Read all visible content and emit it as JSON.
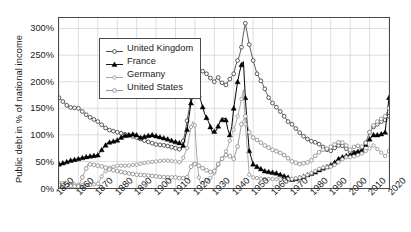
{
  "chart_data": {
    "type": "line",
    "title": "",
    "xlabel": "",
    "ylabel": "Public debt in % of national income",
    "xlim": [
      1850,
      2020
    ],
    "ylim": [
      0,
      320
    ],
    "grid": true,
    "legend_position": "upper-left-inside",
    "ytick_labels": [
      "0%",
      "50%",
      "100%",
      "150%",
      "200%",
      "250%",
      "300%"
    ],
    "ytick_values": [
      0,
      50,
      100,
      150,
      200,
      250,
      300
    ],
    "xtick_labels": [
      "1850",
      "1860",
      "1870",
      "1880",
      "1890",
      "1900",
      "1910",
      "1920",
      "1930",
      "1940",
      "1950",
      "1960",
      "1970",
      "1980",
      "1990",
      "2000",
      "2010",
      "2020"
    ],
    "xtick_values": [
      1850,
      1860,
      1870,
      1880,
      1890,
      1900,
      1910,
      1920,
      1930,
      1940,
      1950,
      1960,
      1970,
      1980,
      1990,
      2000,
      2010,
      2020
    ],
    "series": [
      {
        "name": "United Kingdom",
        "marker": "circle-open-dark",
        "color": "#3b3b3b",
        "x": [
          1850,
          1855,
          1860,
          1865,
          1870,
          1875,
          1880,
          1885,
          1890,
          1895,
          1900,
          1905,
          1910,
          1913,
          1915,
          1918,
          1920,
          1921,
          1922,
          1923,
          1924,
          1925,
          1926,
          1927,
          1928,
          1929,
          1930,
          1931,
          1932,
          1933,
          1934,
          1935,
          1936,
          1937,
          1938,
          1939,
          1940,
          1941,
          1942,
          1943,
          1944,
          1945,
          1946,
          1947,
          1948,
          1950,
          1952,
          1955,
          1958,
          1960,
          1963,
          1965,
          1968,
          1970,
          1973,
          1975,
          1978,
          1980,
          1983,
          1985,
          1988,
          1990,
          1993,
          1995,
          1998,
          2000,
          2003,
          2005,
          2008,
          2010,
          2012,
          2014,
          2016,
          2018,
          2020
        ],
        "y": [
          170,
          152,
          150,
          135,
          125,
          110,
          105,
          100,
          95,
          88,
          82,
          80,
          75,
          72,
          105,
          170,
          200,
          222,
          224,
          222,
          220,
          218,
          215,
          210,
          207,
          203,
          200,
          206,
          208,
          200,
          198,
          196,
          194,
          200,
          205,
          210,
          215,
          230,
          240,
          250,
          265,
          290,
          310,
          290,
          270,
          240,
          215,
          195,
          170,
          160,
          148,
          140,
          125,
          120,
          108,
          100,
          92,
          88,
          85,
          80,
          72,
          70,
          78,
          82,
          74,
          68,
          66,
          68,
          85,
          105,
          115,
          120,
          125,
          128,
          135
        ]
      },
      {
        "name": "France",
        "marker": "triangle-filled",
        "color": "#000000",
        "x": [
          1850,
          1853,
          1856,
          1860,
          1863,
          1866,
          1870,
          1872,
          1875,
          1878,
          1880,
          1883,
          1886,
          1889,
          1892,
          1895,
          1898,
          1900,
          1903,
          1906,
          1909,
          1912,
          1914,
          1916,
          1918,
          1919,
          1920,
          1921,
          1922,
          1923,
          1925,
          1927,
          1929,
          1931,
          1933,
          1935,
          1936,
          1937,
          1938,
          1939,
          1940,
          1941,
          1942,
          1943,
          1944,
          1945,
          1946,
          1947,
          1948,
          1950,
          1953,
          1956,
          1959,
          1962,
          1965,
          1968,
          1970,
          1973,
          1976,
          1979,
          1982,
          1985,
          1988,
          1991,
          1994,
          1997,
          2000,
          2003,
          2006,
          2009,
          2012,
          2015,
          2018,
          2020
        ],
        "y": [
          45,
          48,
          52,
          55,
          58,
          60,
          62,
          72,
          85,
          88,
          90,
          98,
          100,
          102,
          95,
          98,
          100,
          98,
          95,
          92,
          88,
          85,
          80,
          110,
          160,
          175,
          178,
          180,
          175,
          165,
          140,
          125,
          105,
          108,
          125,
          132,
          128,
          110,
          100,
          115,
          150,
          175,
          200,
          218,
          232,
          238,
          170,
          115,
          70,
          45,
          38,
          32,
          30,
          28,
          24,
          20,
          16,
          18,
          22,
          26,
          30,
          36,
          40,
          45,
          55,
          60,
          62,
          68,
          70,
          88,
          100,
          100,
          105,
          170
        ]
      },
      {
        "name": "Germany",
        "marker": "star-light",
        "color": "#9a9a9a",
        "x": [
          1850,
          1855,
          1860,
          1865,
          1870,
          1873,
          1876,
          1880,
          1885,
          1890,
          1895,
          1900,
          1905,
          1910,
          1913,
          1916,
          1918,
          1919,
          1920,
          1921,
          1922,
          1923,
          1925,
          1927,
          1929,
          1931,
          1933,
          1935,
          1937,
          1939,
          1941,
          1943,
          1945,
          1946,
          1948,
          1950,
          1953,
          1956,
          1960,
          1965,
          1970,
          1975,
          1980,
          1985,
          1990,
          1993,
          1995,
          1998,
          2000,
          2003,
          2006,
          2009,
          2012,
          2015,
          2018,
          2020
        ],
        "y": [
          10,
          8,
          6,
          5,
          8,
          28,
          38,
          42,
          42,
          44,
          48,
          50,
          52,
          50,
          48,
          75,
          115,
          125,
          118,
          60,
          20,
          8,
          12,
          16,
          22,
          35,
          52,
          60,
          78,
          100,
          120,
          150,
          185,
          120,
          25,
          20,
          18,
          17,
          17,
          16,
          17,
          20,
          28,
          38,
          40,
          45,
          52,
          58,
          58,
          60,
          65,
          72,
          80,
          70,
          60,
          70
        ]
      },
      {
        "name": "United States",
        "marker": "circle-open-light",
        "color": "#8a8a8a",
        "x": [
          1850,
          1855,
          1860,
          1862,
          1865,
          1867,
          1870,
          1873,
          1876,
          1880,
          1885,
          1890,
          1895,
          1900,
          1905,
          1910,
          1913,
          1916,
          1918,
          1919,
          1920,
          1922,
          1925,
          1928,
          1930,
          1932,
          1934,
          1936,
          1938,
          1940,
          1942,
          1944,
          1946,
          1948,
          1950,
          1953,
          1956,
          1960,
          1963,
          1966,
          1970,
          1974,
          1978,
          1980,
          1983,
          1986,
          1989,
          1992,
          1995,
          1998,
          2000,
          2003,
          2006,
          2008,
          2010,
          2012,
          2014,
          2016,
          2018,
          2020
        ],
        "y": [
          5,
          4,
          3,
          20,
          45,
          44,
          42,
          40,
          35,
          32,
          28,
          25,
          24,
          22,
          20,
          20,
          18,
          20,
          40,
          48,
          45,
          42,
          35,
          30,
          32,
          45,
          55,
          62,
          60,
          55,
          78,
          120,
          135,
          105,
          95,
          88,
          80,
          72,
          68,
          62,
          50,
          45,
          48,
          52,
          65,
          72,
          75,
          82,
          88,
          80,
          72,
          80,
          78,
          85,
          105,
          118,
          125,
          130,
          135,
          150
        ]
      }
    ]
  },
  "axis": {
    "ytitle": "Public debt in % of national income"
  },
  "legend": {
    "items": [
      {
        "label": "United Kingdom",
        "icon": "line-circle-dark-marker"
      },
      {
        "label": "France",
        "icon": "line-triangle-filled-marker"
      },
      {
        "label": "Germany",
        "icon": "line-star-light-marker"
      },
      {
        "label": "United States",
        "icon": "line-circle-light-marker"
      }
    ]
  },
  "colors": {
    "uk": "#3b3b3b",
    "france": "#000000",
    "germany": "#9a9a9a",
    "us": "#8a8a8a",
    "frame": "#4a4a4a",
    "grid": "#cfcfcf",
    "background": "#ffffff"
  }
}
